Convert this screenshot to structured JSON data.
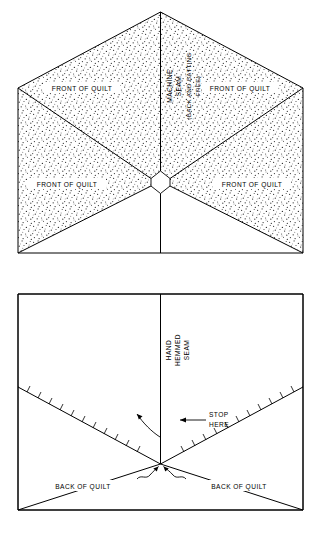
{
  "figure_top": {
    "name": "machine-seam-front-view",
    "labels": {
      "seam_line1": "MACHINE",
      "seam_line2": "SEAM",
      "seam_line3": "(BACK AND BATTING",
      "seam_line4": "FREE)",
      "quad_top_left": "FRONT OF QUILT",
      "quad_top_right": "FRONT OF QUILT",
      "quad_bottom_left": "FRONT OF QUILT",
      "quad_bottom_right": "FRONT OF QUILT"
    }
  },
  "figure_bottom": {
    "name": "hand-hemmed-seam-back-view",
    "labels": {
      "seam_line1": "HAND",
      "seam_line2": "HEMMED",
      "seam_line3": "SEAM",
      "stop_line1": "STOP",
      "stop_line2": "HERE",
      "quad_left": "BACK OF QUILT",
      "quad_right": "BACK OF QUILT"
    }
  },
  "colors": {
    "ink": "#000000",
    "paper": "#ffffff",
    "stipple": "#303030"
  }
}
